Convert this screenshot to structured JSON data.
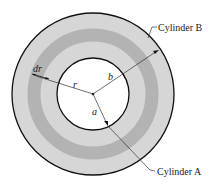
{
  "diagram": {
    "type": "concentric cylinders cross-section",
    "labels": {
      "outer": "Cylinder B",
      "inner": "Cylinder A",
      "radius_r": "r",
      "radius_a": "a",
      "radius_b": "b",
      "thickness": "dr"
    },
    "colors": {
      "fill_light": "#d6d6d6",
      "band_dark": "#b3b3b3",
      "stroke": "#111111"
    }
  }
}
